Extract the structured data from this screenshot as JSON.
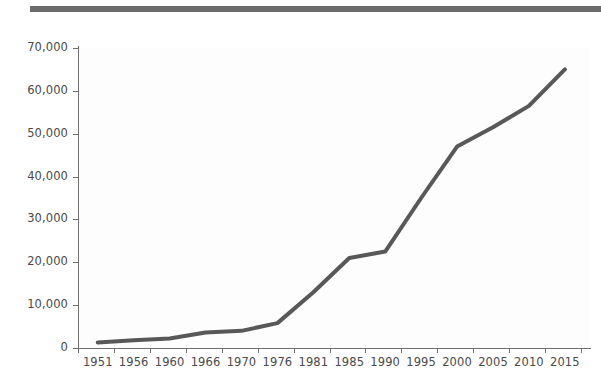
{
  "header": {
    "rule_color": "#6b6b6b"
  },
  "chart_data": {
    "type": "line",
    "title": "",
    "subtitle": "",
    "xlabel": "",
    "ylabel": "",
    "categories": [
      "1951",
      "1956",
      "1960",
      "1966",
      "1970",
      "1976",
      "1981",
      "1985",
      "1990",
      "1995",
      "2000",
      "2005",
      "2010",
      "2015"
    ],
    "values": [
      1300,
      1800,
      2200,
      3600,
      4000,
      5800,
      13000,
      21000,
      22500,
      35000,
      47000,
      51500,
      56500,
      65000
    ],
    "series": [
      {
        "name": "",
        "color": "#585858",
        "values": [
          1300,
          1800,
          2200,
          3600,
          4000,
          5800,
          13000,
          21000,
          22500,
          35000,
          47000,
          51500,
          56500,
          65000
        ]
      }
    ],
    "y_ticks": [
      0,
      10000,
      20000,
      30000,
      40000,
      50000,
      60000,
      70000
    ],
    "y_tick_labels": [
      "0",
      "10,000",
      "20,000",
      "30,000",
      "40,000",
      "50,000",
      "60,000",
      "70,000"
    ],
    "ylim": [
      0,
      70000
    ],
    "grid": false,
    "legend": false,
    "legend_position": "none",
    "line_color": "#585858",
    "line_width": 4,
    "markers": false,
    "plot_background": "#fdfdfd",
    "axis_color": "#6e6e6e",
    "tick_label_color": "#4a4a4a"
  }
}
